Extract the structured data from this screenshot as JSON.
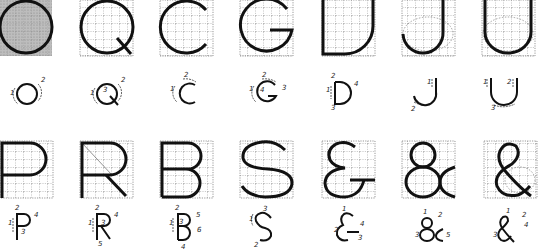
{
  "rows": [
    {
      "row": 1,
      "glyphs": [
        {
          "char": "O",
          "shaded": true,
          "strokes": [
            "1",
            "2"
          ]
        },
        {
          "char": "Q",
          "shaded": false,
          "strokes": [
            "1",
            "2",
            "3"
          ]
        },
        {
          "char": "C",
          "shaded": false,
          "strokes": [
            "1",
            "2"
          ]
        },
        {
          "char": "G",
          "shaded": false,
          "strokes": [
            "1",
            "2",
            "3",
            "4"
          ]
        },
        {
          "char": "D",
          "shaded": false,
          "strokes": [
            "1",
            "2",
            "3",
            "4"
          ]
        },
        {
          "char": "J",
          "shaded": false,
          "strokes": [
            "1",
            "2"
          ]
        },
        {
          "char": "U",
          "shaded": false,
          "strokes": [
            "1",
            "2",
            "3"
          ]
        }
      ]
    },
    {
      "row": 2,
      "glyphs": [
        {
          "char": "P",
          "shaded": false,
          "strokes": [
            "1",
            "2",
            "3",
            "4"
          ]
        },
        {
          "char": "R",
          "shaded": false,
          "strokes": [
            "1",
            "2",
            "3",
            "4",
            "5"
          ]
        },
        {
          "char": "B",
          "shaded": false,
          "strokes": [
            "1",
            "2",
            "3",
            "4",
            "5",
            "6"
          ]
        },
        {
          "char": "S",
          "shaded": false,
          "strokes": [
            "1",
            "2",
            "3"
          ]
        },
        {
          "char": "ε&",
          "shaded": false,
          "strokes": [
            "1",
            "2",
            "3",
            "4"
          ]
        },
        {
          "char": "&",
          "shaded": false,
          "strokes": [
            "1",
            "2",
            "3",
            "4",
            "5"
          ]
        },
        {
          "char": "&",
          "shaded": false,
          "strokes": [
            "1",
            "2",
            "3",
            "4"
          ]
        }
      ]
    }
  ],
  "labels": {
    "O": {
      "n1": "1",
      "n2": "2"
    },
    "Q": {
      "n1": "1",
      "n2": "2",
      "n3": "3"
    },
    "C": {
      "n1": "1",
      "n2": "2"
    },
    "G": {
      "n1": "1",
      "n2": "2",
      "n3": "3",
      "n4": "4"
    },
    "D": {
      "n1": "1",
      "n2": "2",
      "n3": "3",
      "n4": "4"
    },
    "J": {
      "n1": "1",
      "n2": "2"
    },
    "U": {
      "n1": "1",
      "n2": "2",
      "n3": "3"
    },
    "P": {
      "n1": "1",
      "n2": "2",
      "n3": "3",
      "n4": "4"
    },
    "R": {
      "n1": "1",
      "n2": "2",
      "n3": "3",
      "n4": "4",
      "n5": "5"
    },
    "B": {
      "n1": "1",
      "n2": "2",
      "n3": "3",
      "n4": "4",
      "n5": "5",
      "n6": "6"
    },
    "S": {
      "n1": "1",
      "n2": "2",
      "n3": "3"
    },
    "E": {
      "n1": "1",
      "n2": "2",
      "n3": "3",
      "n4": "4"
    },
    "A1": {
      "n1": "1",
      "n2": "2",
      "n3": "3",
      "n4": "4",
      "n5": "5"
    },
    "A2": {
      "n1": "1",
      "n2": "2",
      "n3": "3",
      "n4": "4"
    }
  }
}
